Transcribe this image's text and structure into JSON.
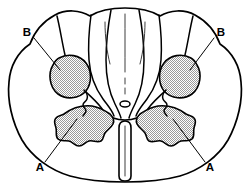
{
  "figure": {
    "name": "spinal-cord-cross-section",
    "background_color": "#ffffff",
    "outline_color": "#000000",
    "shading_color": "#c9c9c9"
  },
  "labels": [
    {
      "id": "label-b-left",
      "text": "B",
      "x": 27,
      "y": 33,
      "anchor": "middle"
    },
    {
      "id": "label-b-right",
      "text": "B",
      "x": 221,
      "y": 33,
      "anchor": "middle"
    },
    {
      "id": "label-a-left",
      "text": "A",
      "x": 40,
      "y": 168,
      "anchor": "middle"
    },
    {
      "id": "label-a-right",
      "text": "A",
      "x": 210,
      "y": 168,
      "anchor": "middle"
    }
  ],
  "leaders": [
    {
      "id": "leader-b-left",
      "from": [
        34,
        38
      ],
      "to": [
        60,
        70
      ]
    },
    {
      "id": "leader-b-right",
      "from": [
        214,
        38
      ],
      "to": [
        192,
        70
      ]
    },
    {
      "id": "leader-a-left",
      "from": [
        45,
        162
      ],
      "to": [
        75,
        120
      ]
    },
    {
      "id": "leader-a-right",
      "from": [
        205,
        162
      ],
      "to": [
        176,
        120
      ]
    }
  ],
  "regions": [
    {
      "id": "region-b-left",
      "label": "B",
      "kind": "rounded-nucleus",
      "side": "left"
    },
    {
      "id": "region-b-right",
      "label": "B",
      "kind": "rounded-nucleus",
      "side": "right"
    },
    {
      "id": "region-a-left",
      "label": "A",
      "kind": "lobulated-nucleus",
      "side": "left"
    },
    {
      "id": "region-a-right",
      "label": "A",
      "kind": "lobulated-nucleus",
      "side": "right"
    }
  ],
  "features": {
    "central_canal": "small central oval",
    "median_fissure": "narrow vertical cleft at inferior midline",
    "folia_count": 4
  }
}
